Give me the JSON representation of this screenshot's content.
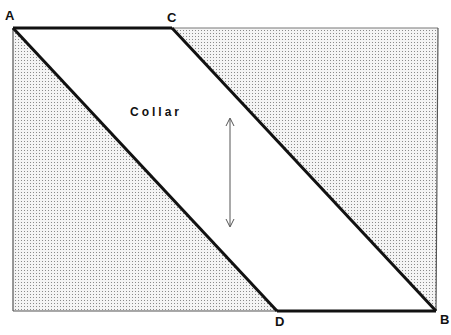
{
  "diagram": {
    "labels": {
      "A": "A",
      "B": "B",
      "C": "C",
      "D": "D",
      "collar": "Collar"
    },
    "colors": {
      "stroke": "#111111",
      "stipple": "#9a9a9a",
      "background": "#ffffff",
      "arrow": "#555555"
    }
  }
}
